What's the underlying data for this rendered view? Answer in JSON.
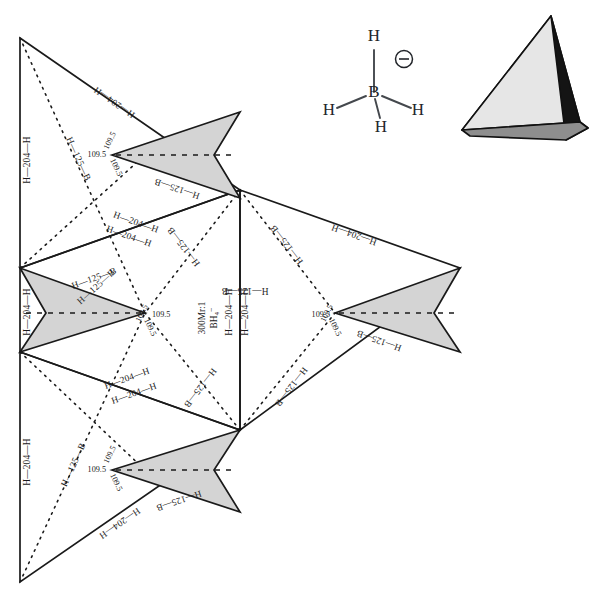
{
  "figure": {
    "title_center": "300Mr:1",
    "species_center": "BH4-",
    "angle_value": "109.5",
    "edge_label_outer": "H—204—H",
    "edge_label_fold": "H—125—B",
    "spine_label": "H—204—H"
  },
  "molecule": {
    "center_atom": "B",
    "hydrogen_top": "H",
    "hydrogen_left": "H",
    "hydrogen_right": "H",
    "hydrogen_bottom": "H",
    "charge": "−"
  },
  "tetrahedron": {
    "face_left_color": "#e6e6e6",
    "face_bottom_color": "#8e8e8e",
    "face_right_color": "#141414"
  },
  "labels": {
    "outer_edges": [
      "H—204—H",
      "H—204—H",
      "H—204—H",
      "H—204—H",
      "H—204—H",
      "H—204—H",
      "H—204—H",
      "H—204—H",
      "H—204—H",
      "H—204—H"
    ],
    "fold_edges": [
      "H—125—B",
      "H—125—B",
      "H—125—B",
      "H—125—B",
      "H—125—B",
      "H—125—B",
      "H—125—B",
      "H—125—B"
    ],
    "angles": [
      "109.5",
      "109.5",
      "109.5",
      "109.5",
      "109.5",
      "109.5",
      "109.5",
      "109.5",
      "109.5",
      "109.5",
      "109.5",
      "109.5"
    ]
  }
}
